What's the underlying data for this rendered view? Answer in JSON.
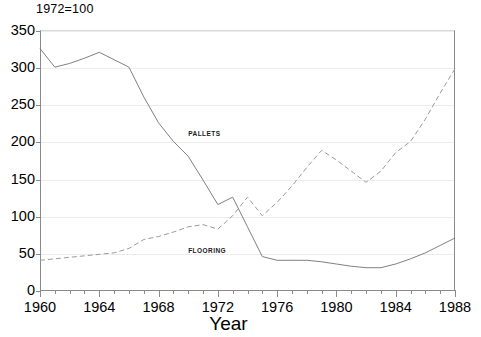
{
  "chart_data": {
    "type": "line",
    "title": "1972=100",
    "xlabel": "Year",
    "ylabel": "",
    "xlim": [
      1960,
      1988
    ],
    "ylim": [
      0,
      350
    ],
    "ytick_step": 50,
    "xtick_major_step": 4,
    "xtick_minor_step": 1,
    "grid": true,
    "legend": "inline-annotations",
    "ytick_labels": [
      "0",
      "50",
      "100",
      "150",
      "200",
      "250",
      "300",
      "350"
    ],
    "ytick_values": [
      0,
      50,
      100,
      150,
      200,
      250,
      300,
      350
    ],
    "xtick_labels": [
      "1960",
      "1964",
      "1968",
      "1972",
      "1976",
      "1980",
      "1984",
      "1988"
    ],
    "xtick_values": [
      1960,
      1964,
      1968,
      1972,
      1976,
      1980,
      1984,
      1988
    ],
    "x": [
      1960,
      1961,
      1962,
      1963,
      1964,
      1965,
      1966,
      1967,
      1968,
      1969,
      1970,
      1971,
      1972,
      1973,
      1974,
      1975,
      1976,
      1977,
      1978,
      1979,
      1980,
      1981,
      1982,
      1983,
      1984,
      1985,
      1986,
      1987,
      1988
    ],
    "series": [
      {
        "name": "PALLETS",
        "style": "solid",
        "color": "#808080",
        "label_x": 1970,
        "label_y": 215,
        "values": [
          325,
          300,
          305,
          312,
          320,
          310,
          300,
          260,
          225,
          200,
          180,
          148,
          115,
          125,
          85,
          45,
          40,
          40,
          40,
          38,
          35,
          32,
          30,
          30,
          35,
          42,
          50,
          60,
          70
        ]
      },
      {
        "name": "FLOORING",
        "style": "dashed",
        "color": "#9a9a9a",
        "label_x": 1970,
        "label_y": 58,
        "values": [
          40,
          42,
          44,
          46,
          48,
          50,
          56,
          68,
          72,
          78,
          85,
          88,
          82,
          100,
          125,
          100,
          118,
          140,
          165,
          188,
          175,
          160,
          145,
          160,
          185,
          200,
          230,
          265,
          298
        ]
      }
    ]
  }
}
